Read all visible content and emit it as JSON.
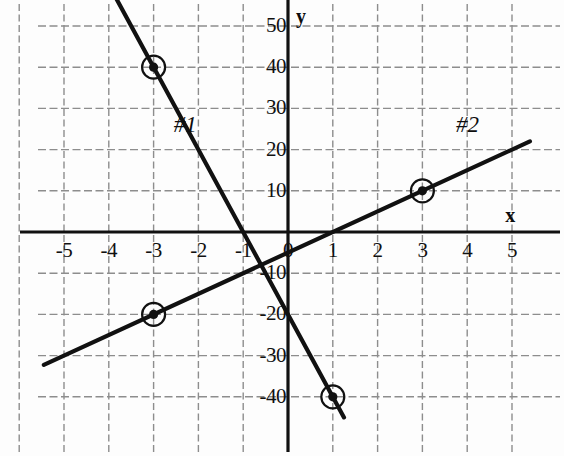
{
  "chart_data": {
    "type": "line",
    "title": "",
    "xlabel": "x",
    "ylabel": "y",
    "xlim": [
      -5.5,
      6.1
    ],
    "ylim": [
      -45.5,
      55.5
    ],
    "grid": true,
    "grid_style": "dashed",
    "x_ticks": [
      -5,
      -4,
      -3,
      -2,
      -1,
      0,
      1,
      2,
      3,
      4,
      5
    ],
    "x_tick_labels": [
      "-5",
      "-4",
      "-3",
      "-2",
      "-1",
      "0",
      "1",
      "2",
      "3",
      "4",
      "5"
    ],
    "y_ticks": [
      50,
      40,
      30,
      20,
      10,
      -10,
      -20,
      -30,
      -40
    ],
    "y_tick_labels": [
      "50",
      "40",
      "30",
      "20",
      "10",
      "-10",
      "-20",
      "-30",
      "-40"
    ],
    "legend_position": "inline-annotation",
    "series": [
      {
        "name": "#1",
        "label": "#1",
        "slope": -20,
        "intercept": -20,
        "color": "#111111",
        "x_start": -4.05,
        "x_end": 1.25,
        "points": [
          {
            "x": -3,
            "y": 40,
            "marked": true
          },
          {
            "x": 1,
            "y": -40,
            "marked": true
          }
        ],
        "annotation": {
          "text": "#1",
          "x": -2.55,
          "y": 26
        }
      },
      {
        "name": "#2",
        "label": "#2",
        "slope": 5,
        "intercept": -5,
        "color": "#111111",
        "x_start": -5.45,
        "x_end": 5.4,
        "points": [
          {
            "x": -3,
            "y": -20,
            "marked": true
          },
          {
            "x": 3,
            "y": 10,
            "marked": true
          }
        ],
        "annotation": {
          "text": "#2",
          "x": 3.75,
          "y": 26
        }
      }
    ],
    "marked_points": [
      {
        "x": -3,
        "y": 40,
        "series": "#1"
      },
      {
        "x": 1,
        "y": -40,
        "series": "#1"
      },
      {
        "x": -3,
        "y": -20,
        "series": "#2"
      },
      {
        "x": 3,
        "y": 10,
        "series": "#2"
      }
    ],
    "axis_color": "#111111",
    "grid_color": "#8d8d8d"
  },
  "axes": {
    "x_axis_label": "x",
    "y_axis_label": "y"
  }
}
